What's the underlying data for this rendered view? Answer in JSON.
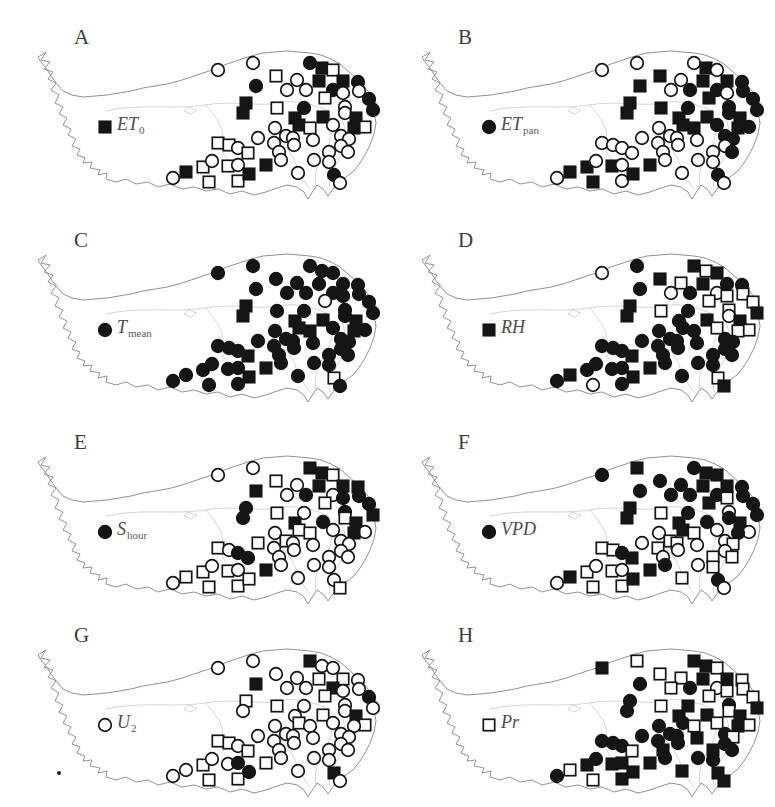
{
  "figure": {
    "description_panels": [
      "A",
      "B",
      "C",
      "D",
      "E",
      "F",
      "G",
      "H"
    ],
    "marker_types": {
      "fc": "filled-circle",
      "oc": "open-circle",
      "fs": "filled-square",
      "os": "open-square"
    },
    "colors": {
      "marker": "#151515",
      "open_marker_fill": "#ffffff",
      "map_outline": "#85858d",
      "map_inner_lines": "#c9c9cf",
      "background": "#ffffff",
      "label_text": "#4c4c4c"
    },
    "stations_xy": [
      [
        208,
        55
      ],
      [
        243,
        48
      ],
      [
        300,
        48
      ],
      [
        312,
        53
      ],
      [
        323,
        55
      ],
      [
        266,
        61
      ],
      [
        287,
        65
      ],
      [
        246,
        71
      ],
      [
        309,
        66
      ],
      [
        333,
        66
      ],
      [
        348,
        67
      ],
      [
        277,
        75
      ],
      [
        296,
        75
      ],
      [
        323,
        75
      ],
      [
        333,
        78
      ],
      [
        349,
        76
      ],
      [
        359,
        84
      ],
      [
        315,
        83
      ],
      [
        335,
        92
      ],
      [
        363,
        95
      ],
      [
        236,
        88
      ],
      [
        233,
        98
      ],
      [
        267,
        93
      ],
      [
        294,
        93
      ],
      [
        285,
        103
      ],
      [
        289,
        110
      ],
      [
        300,
        113
      ],
      [
        313,
        102
      ],
      [
        323,
        110
      ],
      [
        335,
        98
      ],
      [
        346,
        103
      ],
      [
        355,
        112
      ],
      [
        344,
        113
      ],
      [
        265,
        113
      ],
      [
        276,
        121
      ],
      [
        331,
        121
      ],
      [
        339,
        124
      ],
      [
        331,
        131
      ],
      [
        338,
        137
      ],
      [
        303,
        125
      ],
      [
        283,
        123
      ],
      [
        248,
        123
      ],
      [
        208,
        128
      ],
      [
        219,
        130
      ],
      [
        228,
        133
      ],
      [
        238,
        138
      ],
      [
        264,
        128
      ],
      [
        269,
        137
      ],
      [
        284,
        130
      ],
      [
        256,
        150
      ],
      [
        271,
        145
      ],
      [
        288,
        158
      ],
      [
        304,
        145
      ],
      [
        319,
        137
      ],
      [
        319,
        147
      ],
      [
        324,
        160
      ],
      [
        330,
        168
      ],
      [
        193,
        152
      ],
      [
        202,
        146
      ],
      [
        218,
        151
      ],
      [
        228,
        150
      ],
      [
        228,
        166
      ],
      [
        239,
        159
      ],
      [
        199,
        167
      ],
      [
        163,
        163
      ],
      [
        176,
        157
      ],
      [
        95,
        112
      ]
    ],
    "panels": [
      {
        "letter": "A",
        "var_main": "ET",
        "var_sub": "0",
        "types": [
          "oc",
          "oc",
          "fc",
          "fs",
          "os",
          "os",
          "oc",
          "fc",
          "fs",
          "fs",
          "fc",
          "oc",
          "oc",
          "fc",
          "oc",
          "oc",
          "fc",
          "os",
          "oc",
          "fc",
          "fs",
          "fs",
          "os",
          "fc",
          "fs",
          "fs",
          "os",
          "fs",
          "oc",
          "oc",
          "fs",
          "os",
          "fs",
          "oc",
          "oc",
          "oc",
          "oc",
          "oc",
          "oc",
          "oc",
          "oc",
          "oc",
          "os",
          "os",
          "oc",
          "os",
          "oc",
          "oc",
          "oc",
          "fs",
          "oc",
          "oc",
          "oc",
          "oc",
          "oc",
          "fc",
          "oc",
          "os",
          "oc",
          "os",
          "oc",
          "os",
          "fs",
          "os",
          "oc",
          "fs",
          "fs"
        ]
      },
      {
        "letter": "B",
        "var_main": "ET",
        "var_sub": "pan",
        "types": [
          "oc",
          "oc",
          "oc",
          "fs",
          "oc",
          "fs",
          "oc",
          "fs",
          "fs",
          "fs",
          "fc",
          "oc",
          "fc",
          "fc",
          "oc",
          "fc",
          "fc",
          "fs",
          "fc",
          "fc",
          "fs",
          "fs",
          "fs",
          "fc",
          "fs",
          "fs",
          "fs",
          "fs",
          "fc",
          "fc",
          "fs",
          "fc",
          "fs",
          "oc",
          "oc",
          "fc",
          "fc",
          "oc",
          "fc",
          "oc",
          "oc",
          "oc",
          "oc",
          "oc",
          "oc",
          "oc",
          "oc",
          "oc",
          "oc",
          "fs",
          "oc",
          "oc",
          "oc",
          "oc",
          "oc",
          "fc",
          "oc",
          "fs",
          "oc",
          "fs",
          "oc",
          "oc",
          "fs",
          "fs",
          "oc",
          "fs",
          "fc"
        ]
      },
      {
        "letter": "C",
        "var_main": "T",
        "var_sub": "mean",
        "types": [
          "fc",
          "fc",
          "fc",
          "fc",
          "fc",
          "fc",
          "fc",
          "fc",
          "fc",
          "fc",
          "fc",
          "fc",
          "fc",
          "fc",
          "fc",
          "fc",
          "fc",
          "oc",
          "fc",
          "fc",
          "fs",
          "fs",
          "fc",
          "fc",
          "fs",
          "fs",
          "fs",
          "fs",
          "fc",
          "fc",
          "fs",
          "fc",
          "fs",
          "fc",
          "fc",
          "fc",
          "fc",
          "fc",
          "fc",
          "fc",
          "fc",
          "fc",
          "fc",
          "fc",
          "fc",
          "fs",
          "fc",
          "fc",
          "fc",
          "fs",
          "fc",
          "fc",
          "fc",
          "fc",
          "fc",
          "os",
          "fc",
          "fc",
          "fc",
          "fc",
          "fc",
          "fc",
          "fs",
          "fc",
          "fc",
          "fc",
          "fc"
        ]
      },
      {
        "letter": "D",
        "var_main": "RH",
        "var_sub": "",
        "types": [
          "oc",
          "fc",
          "fs",
          "os",
          "fs",
          "fs",
          "os",
          "fc",
          "fs",
          "fc",
          "fc",
          "oc",
          "fc",
          "oc",
          "os",
          "os",
          "os",
          "os",
          "os",
          "fs",
          "fs",
          "fs",
          "os",
          "fc",
          "fc",
          "fc",
          "fc",
          "fs",
          "os",
          "oc",
          "fs",
          "os",
          "os",
          "fc",
          "fc",
          "fc",
          "fc",
          "fc",
          "fc",
          "fc",
          "fc",
          "fc",
          "fc",
          "fc",
          "fc",
          "fs",
          "fc",
          "fc",
          "fc",
          "fs",
          "fc",
          "fc",
          "fc",
          "fc",
          "fc",
          "os",
          "fs",
          "fc",
          "fc",
          "fc",
          "fc",
          "fc",
          "fs",
          "oc",
          "fc",
          "fs",
          "fs"
        ]
      },
      {
        "letter": "E",
        "var_main": "S",
        "var_sub": "hour",
        "types": [
          "oc",
          "oc",
          "fs",
          "fs",
          "os",
          "os",
          "oc",
          "fs",
          "fs",
          "fs",
          "fs",
          "oc",
          "fc",
          "oc",
          "fc",
          "fc",
          "fc",
          "os",
          "fc",
          "fs",
          "fc",
          "fc",
          "os",
          "oc",
          "fs",
          "os",
          "os",
          "fc",
          "oc",
          "os",
          "fs",
          "oc",
          "fs",
          "oc",
          "os",
          "oc",
          "oc",
          "oc",
          "oc",
          "oc",
          "oc",
          "os",
          "os",
          "oc",
          "fc",
          "fc",
          "oc",
          "oc",
          "oc",
          "fs",
          "oc",
          "oc",
          "oc",
          "oc",
          "oc",
          "oc",
          "os",
          "os",
          "oc",
          "os",
          "oc",
          "os",
          "os",
          "os",
          "oc",
          "os",
          "fc"
        ]
      },
      {
        "letter": "F",
        "var_main": "VPD",
        "var_sub": "",
        "types": [
          "fc",
          "fs",
          "fc",
          "fs",
          "fs",
          "fc",
          "fc",
          "fc",
          "fs",
          "fs",
          "fc",
          "fc",
          "fc",
          "fc",
          "os",
          "fc",
          "fc",
          "fs",
          "oc",
          "fc",
          "fs",
          "fs",
          "os",
          "fc",
          "fs",
          "fs",
          "os",
          "fc",
          "oc",
          "fc",
          "fs",
          "oc",
          "fc",
          "oc",
          "os",
          "oc",
          "os",
          "oc",
          "os",
          "oc",
          "os",
          "oc",
          "os",
          "os",
          "fc",
          "fs",
          "os",
          "oc",
          "oc",
          "fs",
          "fc",
          "os",
          "oc",
          "os",
          "os",
          "fc",
          "oc",
          "os",
          "oc",
          "os",
          "oc",
          "os",
          "fs",
          "os",
          "oc",
          "fs",
          "fc"
        ]
      },
      {
        "letter": "G",
        "var_main": "U",
        "var_sub": "2",
        "types": [
          "oc",
          "oc",
          "fs",
          "oc",
          "oc",
          "oc",
          "oc",
          "fs",
          "os",
          "os",
          "oc",
          "oc",
          "oc",
          "fs",
          "oc",
          "oc",
          "fc",
          "os",
          "oc",
          "oc",
          "os",
          "oc",
          "os",
          "oc",
          "oc",
          "os",
          "oc",
          "os",
          "oc",
          "oc",
          "fs",
          "os",
          "oc",
          "oc",
          "oc",
          "oc",
          "oc",
          "oc",
          "oc",
          "oc",
          "oc",
          "oc",
          "os",
          "os",
          "oc",
          "os",
          "oc",
          "oc",
          "oc",
          "os",
          "oc",
          "oc",
          "oc",
          "oc",
          "oc",
          "fs",
          "oc",
          "os",
          "oc",
          "oc",
          "fc",
          "os",
          "fc",
          "os",
          "oc",
          "oc",
          "oc"
        ]
      },
      {
        "letter": "H",
        "var_main": "Pr",
        "var_sub": "",
        "types": [
          "fs",
          "os",
          "fs",
          "fs",
          "os",
          "os",
          "os",
          "fc",
          "fs",
          "fs",
          "os",
          "os",
          "fc",
          "oc",
          "os",
          "os",
          "os",
          "os",
          "fc",
          "fs",
          "fc",
          "fc",
          "os",
          "fs",
          "fs",
          "fc",
          "os",
          "fs",
          "os",
          "os",
          "fs",
          "os",
          "fs",
          "fc",
          "fc",
          "fc",
          "os",
          "fc",
          "fc",
          "fs",
          "fc",
          "fc",
          "fc",
          "fc",
          "fc",
          "os",
          "fc",
          "fs",
          "fc",
          "fs",
          "fc",
          "fs",
          "fc",
          "fs",
          "fc",
          "fs",
          "fs",
          "fs",
          "fc",
          "fs",
          "fs",
          "fs",
          "fs",
          "os",
          "fc",
          "os",
          "os"
        ]
      }
    ],
    "stray_dot": {
      "x": 57,
      "y": 771
    }
  }
}
